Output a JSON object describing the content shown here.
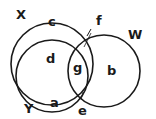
{
  "diagram": {
    "type": "venn",
    "sets": [
      {
        "name": "X",
        "label": "X"
      },
      {
        "name": "Y",
        "label": "Y"
      },
      {
        "name": "W",
        "label": "W"
      }
    ],
    "regions": [
      {
        "id": "a",
        "label": "a"
      },
      {
        "id": "b",
        "label": "b"
      },
      {
        "id": "c",
        "label": "c"
      },
      {
        "id": "d",
        "label": "d"
      },
      {
        "id": "e",
        "label": "e"
      },
      {
        "id": "f",
        "label": "f"
      },
      {
        "id": "g",
        "label": "g"
      }
    ],
    "stroke_color": "#1a1a1a",
    "background": "#ffffff"
  }
}
